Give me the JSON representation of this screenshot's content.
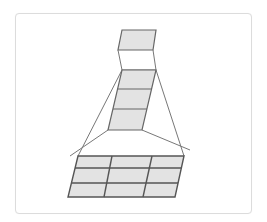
{
  "diagram": {
    "colors": {
      "fill": "#e3e3e3",
      "stroke": "#666666",
      "card_border": "#dcdcdc"
    },
    "top_cell": {
      "points": "122,30 156,30 153,50 118,50"
    },
    "top_connector": {
      "points": "118,50 122,70 156,70 153,50"
    },
    "middle_stack": {
      "rows": 3,
      "outline": "122,70 156,70 142,130 108,130",
      "row_lines": [
        "117,89 152,89",
        "113,109 147,109"
      ]
    },
    "connectors": [
      "122,70 78,156",
      "108,130 70,156",
      "156,70 184,156",
      "142,130 190,150"
    ],
    "bottom_grid": {
      "rows": 3,
      "cols": 3,
      "outline": "78,156 184,156 175,197 68,197",
      "row_lines": [
        "75,168 181,168",
        "72,183 178,183"
      ],
      "col_lines": [
        "112,156 104,197",
        "152,156 143,197"
      ]
    }
  }
}
